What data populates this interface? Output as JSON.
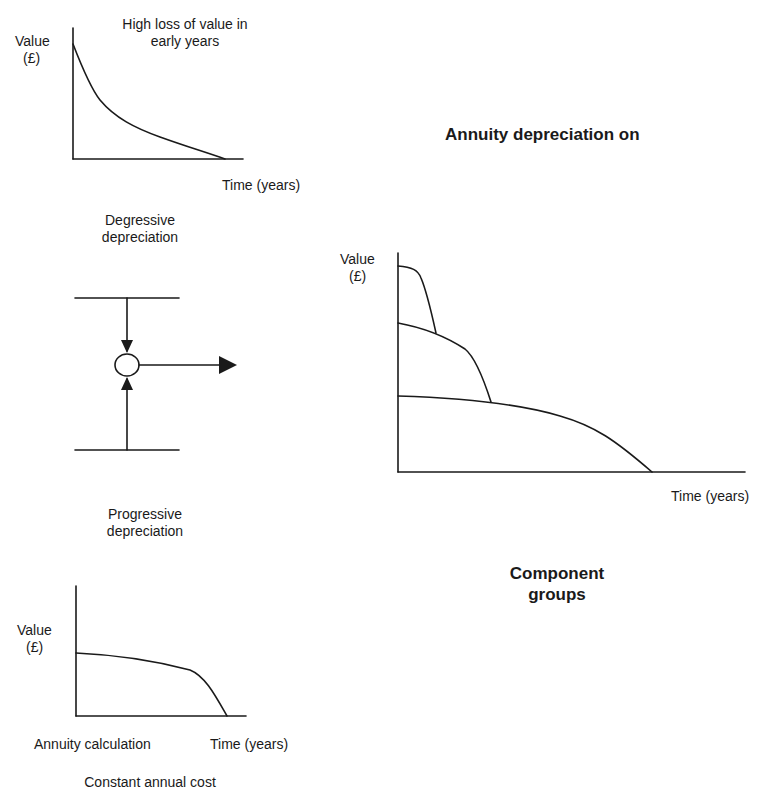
{
  "degressive": {
    "y_label": "Value",
    "y_unit": "(£)",
    "annotation_line1": "High loss of value in",
    "annotation_line2": "early years",
    "x_label": "Time (years)",
    "caption_line1": "Degressive",
    "caption_line2": "depreciation"
  },
  "progressive": {
    "caption_line1": "Progressive",
    "caption_line2": "depreciation"
  },
  "annuity": {
    "y_label": "Value",
    "y_unit": "(£)",
    "left_label": "Annuity calculation",
    "x_label": "Time (years)",
    "caption": "Constant annual cost"
  },
  "component_groups": {
    "title": "Annuity depreciation on",
    "y_label": "Value",
    "y_unit": "(£)",
    "x_label": "Time (years)",
    "caption_line1": "Component",
    "caption_line2": "groups"
  },
  "colors": {
    "ink": "#1a1a1a",
    "background": "#ffffff"
  }
}
